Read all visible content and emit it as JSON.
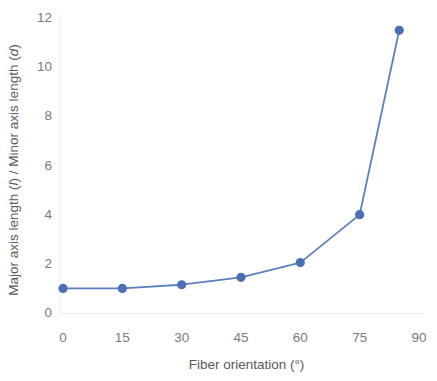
{
  "chart_data": {
    "type": "line",
    "title": "",
    "subtitle": "",
    "xlabel": "Fiber orientation (°)",
    "ylabel_parts": {
      "prefix": "Major axis length (",
      "symbol1": "l",
      "middle": ") / Minor axis length (",
      "symbol2": "d",
      "suffix": ")"
    },
    "ylabel": "Major axis length (l) / Minor axis length (d)",
    "x": [
      0,
      15,
      30,
      45,
      60,
      75,
      85
    ],
    "values": [
      1.0,
      1.0,
      1.15,
      1.45,
      2.05,
      4.0,
      11.5
    ],
    "series": [
      {
        "name": "Aspect ratio",
        "x": [
          0,
          15,
          30,
          45,
          60,
          75,
          85
        ],
        "values": [
          1.0,
          1.0,
          1.15,
          1.45,
          2.05,
          4.0,
          11.5
        ]
      }
    ],
    "xlim": [
      0,
      90
    ],
    "ylim": [
      0,
      12
    ],
    "xticks": [
      0,
      15,
      30,
      45,
      60,
      75,
      90
    ],
    "xtick_labels": [
      "0",
      "15",
      "30",
      "45",
      "60",
      "75",
      "90"
    ],
    "yticks": [
      0,
      2,
      4,
      6,
      8,
      10,
      12
    ],
    "ytick_labels": [
      "0",
      "2",
      "4",
      "6",
      "8",
      "10",
      "12"
    ],
    "grid": false,
    "legend": null,
    "legend_position": "none",
    "annotations": [],
    "colors": {
      "series": "#5B7FC0",
      "marker": "#4A6FB5",
      "axis_text": "#7a7a7a",
      "axis_title": "#595959",
      "axis_line": "#f2f2f2",
      "background": "#ffffff"
    },
    "marker": {
      "shape": "circle",
      "radius": 4.6
    },
    "line_width": 1.8
  }
}
